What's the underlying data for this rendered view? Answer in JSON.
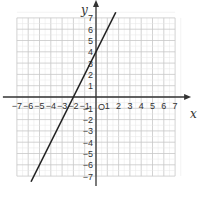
{
  "chart_data": {
    "type": "line",
    "title": "",
    "xlabel": "x",
    "ylabel": "y",
    "origin_label": "O",
    "xlim": [
      -7,
      7
    ],
    "ylim": [
      -7,
      7
    ],
    "grid": true,
    "x_ticks": [
      "-7",
      "-6",
      "-5",
      "-4",
      "-3",
      "-2",
      "-1",
      "1",
      "2",
      "3",
      "4",
      "5",
      "6",
      "7"
    ],
    "y_ticks": [
      "7",
      "6",
      "5",
      "4",
      "3",
      "2",
      "1",
      "-1",
      "-2",
      "-3",
      "-4",
      "-5",
      "-6",
      "-7"
    ],
    "series": [
      {
        "name": "y = 2x + 4",
        "slope": 2,
        "intercept": 4,
        "x": [
          -5.75,
          1.75
        ],
        "y": [
          -7.5,
          7.5
        ]
      }
    ],
    "colors": {
      "grid": "#c8c8c8",
      "axis": "#333333",
      "line": "#222222"
    }
  }
}
